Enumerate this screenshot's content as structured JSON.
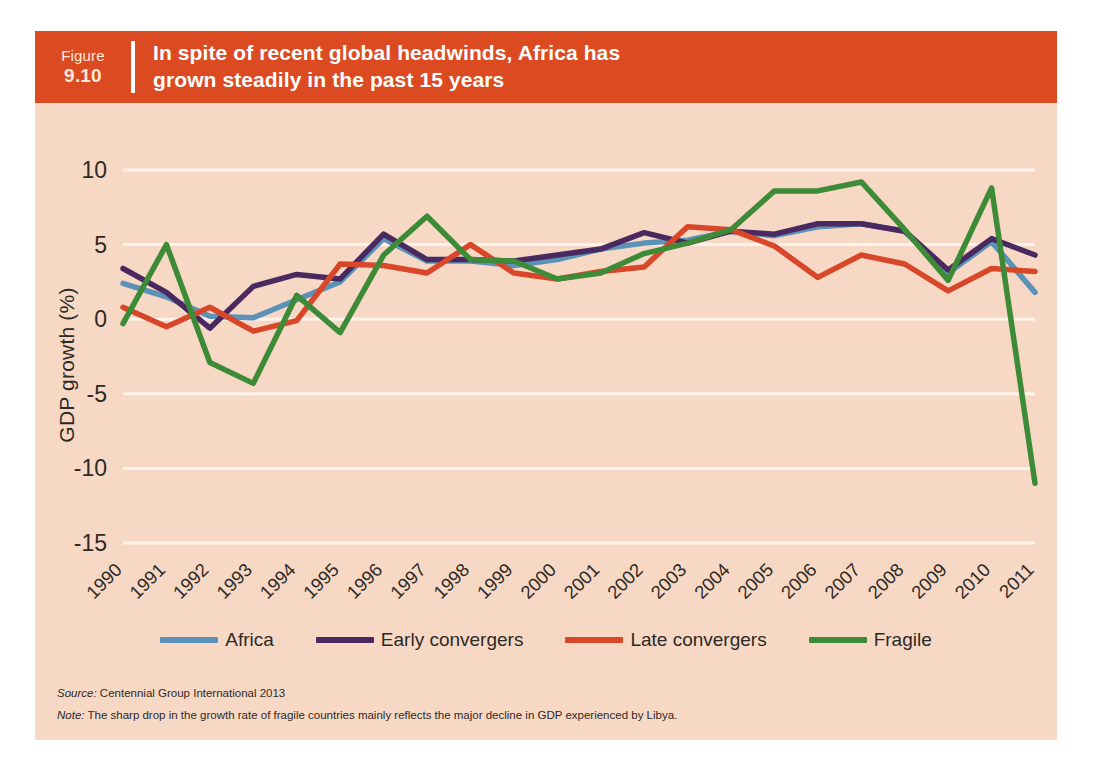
{
  "header": {
    "figure_word": "Figure",
    "figure_number": "9.10",
    "title": "In spite of recent global headwinds, Africa has\ngrown steadily in the past 15 years"
  },
  "colors": {
    "band": "#dc4a22",
    "panel": "#f7d8c4",
    "gridline": "#fdf3ec",
    "africa": "#5b92b8",
    "early_convergers": "#4a2960",
    "late_convergers": "#d9472a",
    "fragile": "#3d8b37",
    "text": "#2d2a26"
  },
  "legend": {
    "position": "bottom",
    "items": [
      {
        "label": "Africa",
        "color": "#5b92b8"
      },
      {
        "label": "Early convergers",
        "color": "#4a2960"
      },
      {
        "label": "Late convergers",
        "color": "#d9472a"
      },
      {
        "label": "Fragile",
        "color": "#3d8b37"
      }
    ]
  },
  "footnotes": {
    "source_key": "Source:",
    "source_text": "Centennial Group International 2013",
    "note_key": "Note:",
    "note_text": "The sharp drop in the growth rate of fragile countries mainly reflects the major decline in GDP experienced by Libya."
  },
  "chart_data": {
    "type": "line",
    "title": "In spite of recent global headwinds, Africa has grown steadily in the past 15 years",
    "xlabel": "",
    "ylabel": "GDP growth (%)",
    "ylim": [
      -15,
      10
    ],
    "yticks": [
      10,
      5,
      0,
      -5,
      -10,
      -15
    ],
    "ytick_labels": [
      "10",
      "5",
      "0",
      "-5",
      "-10",
      "-15"
    ],
    "grid": "horizontal",
    "x_tick_rotation": -45,
    "categories": [
      "1990",
      "1991",
      "1992",
      "1993",
      "1994",
      "1995",
      "1996",
      "1997",
      "1998",
      "1999",
      "2000",
      "2001",
      "2002",
      "2003",
      "2004",
      "2005",
      "2006",
      "2007",
      "2008",
      "2009",
      "2010",
      "2011"
    ],
    "series": [
      {
        "name": "Africa",
        "color": "#5b92b8",
        "values": [
          2.4,
          1.5,
          0.2,
          0.1,
          1.3,
          2.5,
          5.4,
          3.9,
          3.9,
          3.6,
          4.0,
          4.7,
          5.1,
          5.3,
          5.9,
          5.6,
          6.2,
          6.4,
          5.9,
          3.1,
          5.2,
          1.8
        ]
      },
      {
        "name": "Early convergers",
        "color": "#4a2960",
        "values": [
          3.4,
          1.8,
          -0.6,
          2.2,
          3.0,
          2.7,
          5.7,
          4.0,
          4.0,
          3.9,
          4.3,
          4.7,
          5.8,
          5.1,
          5.9,
          5.7,
          6.4,
          6.4,
          5.9,
          3.3,
          5.4,
          4.3
        ]
      },
      {
        "name": "Late convergers",
        "color": "#d9472a",
        "values": [
          0.8,
          -0.5,
          0.8,
          -0.8,
          -0.1,
          3.7,
          3.6,
          3.1,
          5.0,
          3.1,
          2.7,
          3.2,
          3.5,
          6.2,
          6.0,
          4.9,
          2.8,
          4.3,
          3.7,
          1.9,
          3.4,
          3.2
        ]
      },
      {
        "name": "Fragile",
        "color": "#3d8b37",
        "values": [
          -0.3,
          5.0,
          -2.9,
          -4.3,
          1.6,
          -0.9,
          4.3,
          6.9,
          4.0,
          3.9,
          2.7,
          3.1,
          4.4,
          5.1,
          6.0,
          8.6,
          8.6,
          9.2,
          6.0,
          2.6,
          8.8,
          -11.0
        ]
      }
    ]
  }
}
